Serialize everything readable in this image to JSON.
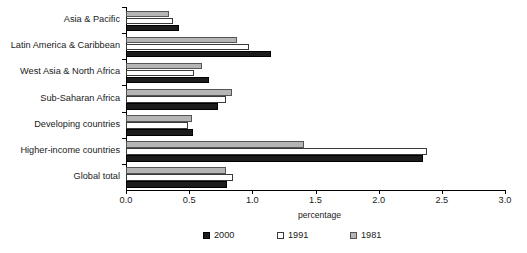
{
  "chart_data": {
    "type": "bar",
    "orientation": "horizontal",
    "title": "",
    "xlabel": "percentage",
    "ylabel": "",
    "xlim": [
      0.0,
      3.0
    ],
    "xticks": [
      "0.0",
      "0.5",
      "1.0",
      "1.5",
      "2.0",
      "2.5",
      "3.0"
    ],
    "xtick_values": [
      0.0,
      0.5,
      1.0,
      1.5,
      2.0,
      2.5,
      3.0
    ],
    "grid": false,
    "legend_position": "bottom",
    "categories": [
      "Asia & Pacific",
      "Latin America & Caribbean",
      "West Asia & North Africa",
      "Sub-Saharan Africa",
      "Developing countries",
      "Higher-income countries",
      "Global total"
    ],
    "series": [
      {
        "name": "2000",
        "color": "#1c1c1c",
        "values": [
          0.42,
          1.15,
          0.66,
          0.73,
          0.53,
          2.35,
          0.8
        ]
      },
      {
        "name": "1991",
        "color": "#ffffff",
        "values": [
          0.37,
          0.97,
          0.54,
          0.79,
          0.49,
          2.38,
          0.85
        ]
      },
      {
        "name": "1981",
        "color": "#b5b5b5",
        "values": [
          0.34,
          0.88,
          0.6,
          0.84,
          0.52,
          1.41,
          0.79
        ]
      }
    ]
  },
  "legend": {
    "items": [
      {
        "label": "2000",
        "swatch": "black-square-swatch"
      },
      {
        "label": "1991",
        "swatch": "white-square-swatch"
      },
      {
        "label": "1981",
        "swatch": "gray-square-swatch"
      }
    ]
  },
  "axis": {
    "x_title": "percentage"
  }
}
